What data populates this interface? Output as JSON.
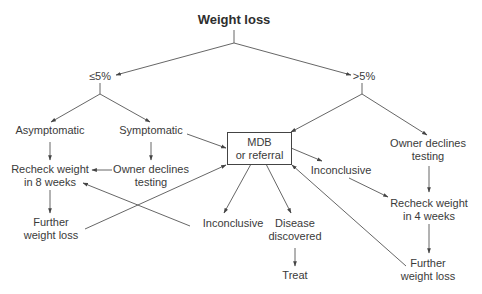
{
  "diagram": {
    "title": "Weight loss",
    "branches": {
      "low": "≤5%",
      "high": ">5%"
    },
    "nodes": {
      "asymptomatic": "Asymptomatic",
      "symptomatic": "Symptomatic",
      "recheck_8": [
        "Recheck weight",
        "in 8 weeks"
      ],
      "owner_declines_left": [
        "Owner declines",
        "testing"
      ],
      "further_loss_left": [
        "Further",
        "weight loss"
      ],
      "mdb": [
        "MDB",
        "or referral"
      ],
      "inconclusive_left": "Inconclusive",
      "disease": [
        "Disease",
        "discovered"
      ],
      "treat": "Treat",
      "inconclusive_right": "Inconclusive",
      "owner_declines_right": [
        "Owner declines",
        "testing"
      ],
      "recheck_4": [
        "Recheck weight",
        "in 4 weeks"
      ],
      "further_loss_right": [
        "Further",
        "weight loss"
      ]
    },
    "colors": {
      "line": "#444444",
      "text": "#3a3a3a"
    }
  }
}
